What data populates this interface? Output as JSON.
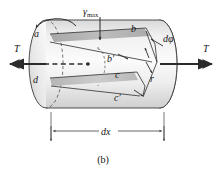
{
  "figure": {
    "caption": "(b)",
    "type": "engineering-diagram"
  },
  "labels": {
    "gamma_symbol": "γ",
    "gamma_subscript": "max",
    "torque_left": "T",
    "torque_right": "T",
    "point_a": "a",
    "point_b": "b",
    "point_b_prime": "b′",
    "point_c": "c",
    "point_c_prime": "c′",
    "point_d": "d",
    "angle_dphi": "dφ",
    "radius_r": "r",
    "length_dx": "dx"
  },
  "colors": {
    "outline": "#3a3a3a",
    "body_light": "#f3f3f3",
    "body_mid": "#e2e2e2",
    "body_shadow": "#c9c9c9",
    "element_strip": "#b3b3b3",
    "end_face": "#ebebeb",
    "arrow": "#2b2b2b",
    "dimension": "#4a4a4a",
    "background": "#ffffff"
  },
  "geometry": {
    "left_face_center_x": 46,
    "right_face_center_x": 160,
    "axis_y": 64,
    "cylinder_radius_y": 44,
    "ellipse_radius_x": 17,
    "dx_dimension_y": 134,
    "dx_left_x": 51,
    "dx_right_x": 164
  }
}
